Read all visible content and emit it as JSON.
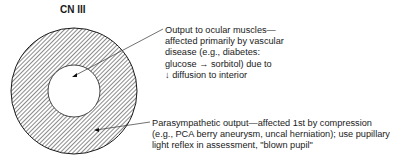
{
  "diagram": {
    "title": "CN III",
    "inner_label": {
      "lines": [
        "Output to ocular muscles—",
        "affected primarily by vascular",
        "disease (e.g., diabetes:",
        "glucose → sorbitol) due to",
        "↓ diffusion to interior"
      ]
    },
    "outer_label": {
      "lines": [
        "Parasympathetic output—affected 1st by compression",
        "(e.g., PCA berry aneurysm, uncal herniation); use pupillary",
        "light reflex in assessment, \"blown pupil\""
      ]
    },
    "colors": {
      "hatch": "#2a2a2a",
      "stroke": "#1a1a1a",
      "background": "#ffffff"
    }
  }
}
